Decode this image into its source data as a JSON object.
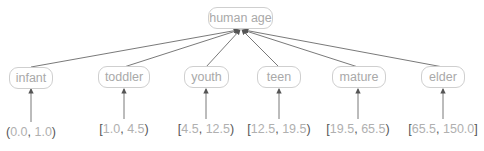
{
  "diagram": {
    "type": "hierarchy",
    "root": {
      "label": "human age"
    },
    "categories": [
      {
        "label": "infant",
        "range_open": "(",
        "range_low": "0.0",
        "range_sep": ", ",
        "range_high": "1.0",
        "range_close": ")"
      },
      {
        "label": "toddler",
        "range_open": "[",
        "range_low": "1.0",
        "range_sep": ", ",
        "range_high": "4.5",
        "range_close": ")"
      },
      {
        "label": "youth",
        "range_open": "[",
        "range_low": "4.5",
        "range_sep": ", ",
        "range_high": "12.5",
        "range_close": ")"
      },
      {
        "label": "teen",
        "range_open": "[",
        "range_low": "12.5",
        "range_sep": ", ",
        "range_high": "19.5",
        "range_close": ")"
      },
      {
        "label": "mature",
        "range_open": "[",
        "range_low": "19.5",
        "range_sep": ", ",
        "range_high": "65.5",
        "range_close": ")"
      },
      {
        "label": "elder",
        "range_open": "[",
        "range_low": "65.5",
        "range_sep": ", ",
        "range_high": "150.0",
        "range_close": "]"
      }
    ],
    "colors": {
      "node_border": "#cfcfcf",
      "node_text": "#a9a9a9",
      "edge": "#666666",
      "bracket": "#555555",
      "range_number": "#b0b0b0"
    }
  }
}
